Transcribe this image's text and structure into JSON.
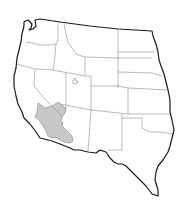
{
  "map": {
    "title": "",
    "subject": "Western United States",
    "states_shown": [
      "Washington",
      "Oregon",
      "California",
      "Idaho",
      "Nevada",
      "Utah",
      "Arizona",
      "Montana",
      "Wyoming",
      "Colorado",
      "New Mexico",
      "North Dakota",
      "South Dakota",
      "Nebraska",
      "Kansas",
      "Oklahoma",
      "Texas"
    ],
    "highlighted_region": {
      "name": "Shaded desert region (southeastern California, southern Nevada, western Arizona)",
      "color": "#c8c8c8"
    },
    "colors": {
      "background": "#ffffff",
      "outline": "#1a1a1a",
      "state_borders": "#8a8a8a",
      "highlight": "#c8c8c8"
    }
  }
}
